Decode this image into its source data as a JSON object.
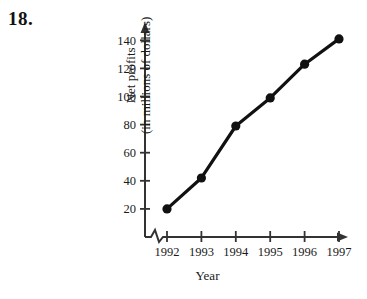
{
  "problem": {
    "number": "18."
  },
  "chart_data": {
    "type": "line",
    "title": "",
    "xlabel": "Year",
    "ylabel": "Net profits (in millions of dollars)",
    "ylabel_line1": "Net profits",
    "ylabel_line2": "(in millions of dollars)",
    "categories": [
      "1992",
      "1993",
      "1994",
      "1995",
      "1996",
      "1997"
    ],
    "values": [
      20,
      42,
      79,
      99,
      123,
      141
    ],
    "points": [
      {
        "x": "1992",
        "y": 20
      },
      {
        "x": "1993",
        "y": 42
      },
      {
        "x": "1994",
        "y": 79
      },
      {
        "x": "1995",
        "y": 99
      },
      {
        "x": "1996",
        "y": 123
      },
      {
        "x": "1997",
        "y": 141
      }
    ],
    "yticks": [
      20,
      40,
      60,
      80,
      100,
      120,
      140
    ],
    "ytick_labels": [
      "20",
      "40",
      "60",
      "80",
      "100",
      "120",
      "140"
    ],
    "xtick_labels": [
      "1992",
      "1993",
      "1994",
      "1995",
      "1996",
      "1997"
    ],
    "ylim": [
      0,
      152
    ],
    "grid": false,
    "legend": false,
    "legend_position": "none",
    "axis_break": true,
    "axis_break_note": "zigzag break on horizontal axis near origin",
    "marker": "filled-circle",
    "line_color": "#111111",
    "marker_color": "#111111",
    "axis_color": "#333333",
    "background_color": "#ffffff"
  }
}
